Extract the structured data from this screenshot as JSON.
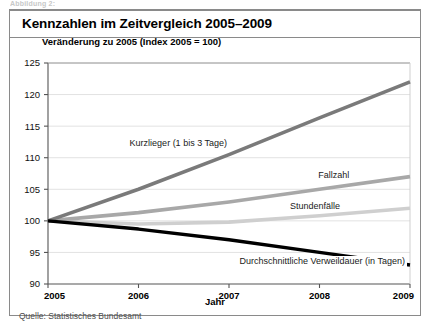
{
  "top_caption": "Abbildung 2:",
  "panel": {
    "title": "Kennzahlen im Zeitvergleich 2005–2009"
  },
  "chart_subtitle": "Veränderung zu 2005 (Index 2005 = 100)",
  "axis_label_x": "Jahr",
  "source_note": "Quelle: Statistisches Bundesamt",
  "colors": {
    "kurzlieger": "#7a7a7a",
    "fallzahl": "#a8a8a8",
    "stundenfaelle": "#cfcfcf",
    "verweildauer": "#000000",
    "grid": "#e2e2e2",
    "axis": "#555555",
    "frame": "#8a8a8a"
  },
  "chart_data": {
    "type": "line",
    "title": "Kennzahlen im Zeitvergleich 2005–2009",
    "subtitle": "Veränderung zu 2005 (Index 2005 = 100)",
    "xlabel": "Jahr",
    "ylabel": "",
    "x": [
      2005,
      2006,
      2007,
      2008,
      2009
    ],
    "xtick_labels": [
      "2005",
      "2006",
      "2007",
      "2008",
      "2009"
    ],
    "ytick_labels": [
      "90",
      "95",
      "100",
      "105",
      "110",
      "115",
      "120",
      "125"
    ],
    "yticks": [
      90,
      95,
      100,
      105,
      110,
      115,
      120,
      125
    ],
    "ylim": [
      90,
      125
    ],
    "xlim": [
      2005,
      2009
    ],
    "grid": true,
    "legend": "inline-annotations",
    "series": [
      {
        "name": "Kurzlieger (1 bis 3 Tage)",
        "color": "#7a7a7a",
        "values": [
          100.0,
          105.0,
          110.5,
          116.3,
          122.0
        ]
      },
      {
        "name": "Fallzahl",
        "color": "#a8a8a8",
        "values": [
          100.0,
          101.3,
          103.0,
          105.0,
          107.0
        ]
      },
      {
        "name": "Stundenfälle",
        "color": "#cfcfcf",
        "values": [
          100.0,
          99.5,
          99.8,
          100.8,
          102.0
        ]
      },
      {
        "name": "Durchschnittliche Verweildauer (in Tagen)",
        "color": "#000000",
        "values": [
          100.0,
          98.7,
          97.0,
          95.0,
          93.0
        ]
      }
    ],
    "annotations": [
      {
        "text": "Kurzlieger (1 bis 3 Tage)",
        "series": "Kurzlieger (1 bis 3 Tage)"
      },
      {
        "text": "Fallzahl",
        "series": "Fallzahl"
      },
      {
        "text": "Stundenfälle",
        "series": "Stundenfälle"
      },
      {
        "text": "Durchschnittliche Verweildauer (in Tagen)",
        "series": "Durchschnittliche Verweildauer (in Tagen)"
      }
    ]
  }
}
